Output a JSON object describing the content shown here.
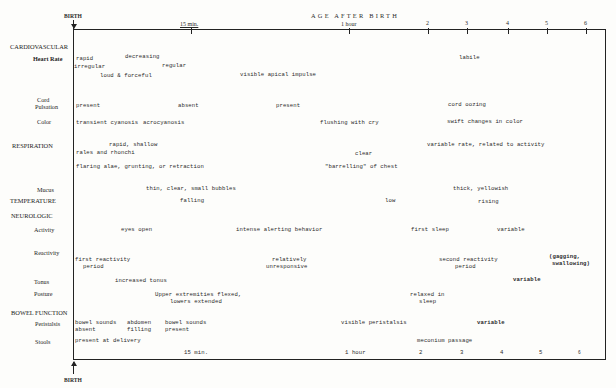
{
  "header": {
    "title": "AGE AFTER BIRTH",
    "birth_top": "BIRTH",
    "birth_bottom": "BIRTH"
  },
  "top_axis": [
    "15 min.",
    "1 hour",
    "2",
    "3",
    "4",
    "5",
    "6"
  ],
  "bottom_axis": [
    "15 min.",
    "1 hour",
    "2",
    "3",
    "4",
    "5",
    "6"
  ],
  "sections": {
    "cardiovascular": "CARDIOVASCULAR",
    "respiration": "RESPIRATION",
    "temperature": "TEMPERATURE",
    "neurologic": "NEUROLOGIC",
    "bowel": "BOWEL FUNCTION"
  },
  "rows": {
    "heart_rate": "Heart Rate",
    "cord": "Cord",
    "pulsation": "Pulsation",
    "color": "Color",
    "mucus": "Mucus",
    "activity": "Activity",
    "reactivity": "Reactivity",
    "tonus": "Tonus",
    "posture": "Posture",
    "peristalsis": "Peristalsis",
    "stools": "Stools"
  },
  "entries": {
    "hr_rapid": "rapid",
    "hr_decreasing": "decreasing",
    "hr_labile": "labile",
    "hr_irregular": "irregular",
    "hr_regular": "regular",
    "hr_loud": "loud & forceful",
    "hr_apical": "visible apical impulse",
    "cord_present1": "present",
    "cord_absent": "absent",
    "cord_present2": "present",
    "cord_oozing": "cord oozing",
    "color_transient": "transient cyanosis",
    "color_acro": "acrocyanosis",
    "color_flushing": "flushing with cry",
    "color_swift": "swift changes in color",
    "resp_rapid": "rapid, shallow",
    "resp_variable": "variable rate, related to activity",
    "resp_rales": "rales and rhonchi",
    "resp_clear": "clear",
    "resp_flaring": "flaring alae, grunting, or retraction",
    "resp_barreling": "\"barrelling\" of chest",
    "mucus_thin": "thin, clear, small bubbles",
    "mucus_thick": "thick, yellowish",
    "temp_falling": "falling",
    "temp_low": "low",
    "temp_rising": "rising",
    "act_eyes": "eyes open",
    "act_intense": "intense alerting behavior",
    "act_sleep": "first sleep",
    "act_variable": "variable",
    "react_first1": "first reactivity",
    "react_first2": "period",
    "react_rel1": "relatively",
    "react_rel2": "unresponsive",
    "react_second1": "second reactivity",
    "react_second2": "period",
    "react_gag1": "(gagging,",
    "react_gag2": "swallowing)",
    "tonus_increased": "increased tonus",
    "tonus_variable": "variable",
    "posture_upper1": "Upper extremities flexed,",
    "posture_upper2": "lowers extended",
    "posture_relaxed1": "relaxed in",
    "posture_relaxed2": "sleep",
    "per_bs1a": "bowel sounds",
    "per_bs1b": "absent",
    "per_abd1": "abdomen",
    "per_abd2": "filling",
    "per_bs2a": "bowel sounds",
    "per_bs2b": "present",
    "per_visible": "visible peristalsis",
    "per_variable": "variable",
    "stools_present": "present at delivery",
    "stools_meconium": "meconium passage"
  }
}
